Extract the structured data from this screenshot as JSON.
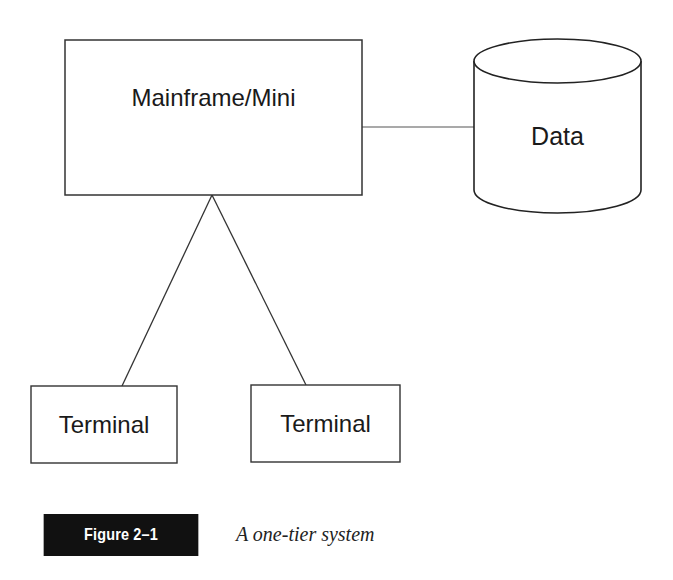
{
  "diagram": {
    "nodes": {
      "mainframe": {
        "label": "Mainframe/Mini",
        "shape": "rectangle"
      },
      "data": {
        "label": "Data",
        "shape": "cylinder"
      },
      "terminal_1": {
        "label": "Terminal",
        "shape": "rectangle"
      },
      "terminal_2": {
        "label": "Terminal",
        "shape": "rectangle"
      }
    },
    "edges": [
      {
        "from": "mainframe",
        "to": "data"
      },
      {
        "from": "mainframe",
        "to": "terminal_1"
      },
      {
        "from": "mainframe",
        "to": "terminal_2"
      }
    ]
  },
  "caption": {
    "figure_label": "Figure 2–1",
    "text": "A one-tier system"
  },
  "colors": {
    "stroke": "#333333",
    "caption_bg": "#111111",
    "caption_fg": "#ffffff"
  }
}
